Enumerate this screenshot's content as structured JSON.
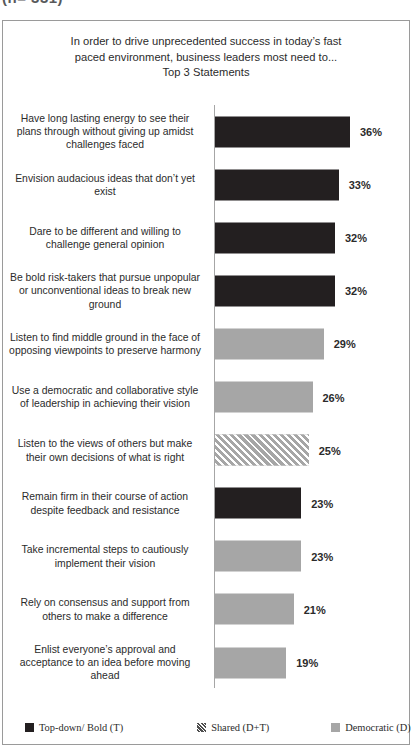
{
  "header": {
    "cropped_text": "(n= 331)"
  },
  "chart_data": {
    "type": "bar",
    "orientation": "horizontal",
    "title": "In order to drive unprecedented success in today’s fast paced environment, business leaders most need to... Top 3 Statements",
    "title_lines": [
      "In order to drive unprecedented success in today’s fast",
      "paced environment, business leaders most need to...",
      "Top 3 Statements"
    ],
    "xlabel": "",
    "ylabel": "",
    "xlim": [
      0,
      40
    ],
    "grid": false,
    "legend_position": "bottom",
    "categories": [
      "Have long lasting energy to see their plans through without giving up amidst challenges faced",
      "Envision audacious ideas that don’t yet exist",
      "Dare to be different and willing to challenge  general opinion",
      "Be bold risk-takers  that pursue unpopular or unconventional ideas to break new ground",
      "Listen to find middle ground in the face of opposing viewpoints  to preserve harmony",
      "Use a democratic and collaborative style of leadership  in achieving their vision",
      "Listen to the views of others but make their own decisions of what is right",
      "Remain firm in their course of action despite feedback and resistance",
      "Take incremental steps to cautiously implement their vision",
      "Rely on consensus and support from others to make a difference",
      "Enlist everyone’s approval and acceptance to an idea before moving ahead"
    ],
    "values": [
      36,
      33,
      32,
      32,
      29,
      26,
      25,
      23,
      23,
      21,
      19
    ],
    "value_labels": [
      "36%",
      "33%",
      "32%",
      "32%",
      "29%",
      "26%",
      "25%",
      "23%",
      "23%",
      "21%",
      "19%"
    ],
    "groups": [
      "topdown",
      "topdown",
      "topdown",
      "topdown",
      "democratic",
      "democratic",
      "shared",
      "topdown",
      "democratic",
      "democratic",
      "democratic"
    ],
    "legend": [
      {
        "label": "Top-down/ Bold (T)",
        "key": "topdown",
        "color": "#231f20"
      },
      {
        "label": "Shared (D+T)",
        "key": "shared",
        "color": "#a6a6a6"
      },
      {
        "label": "Democratic (D)",
        "key": "democratic",
        "color": "#a6a6a6"
      }
    ],
    "colors": {
      "topdown": "#231f20",
      "democratic": "#a6a6a6",
      "shared": "#a6a6a6",
      "text": "#2b2b2b",
      "frame": "#9a9a9a"
    }
  }
}
